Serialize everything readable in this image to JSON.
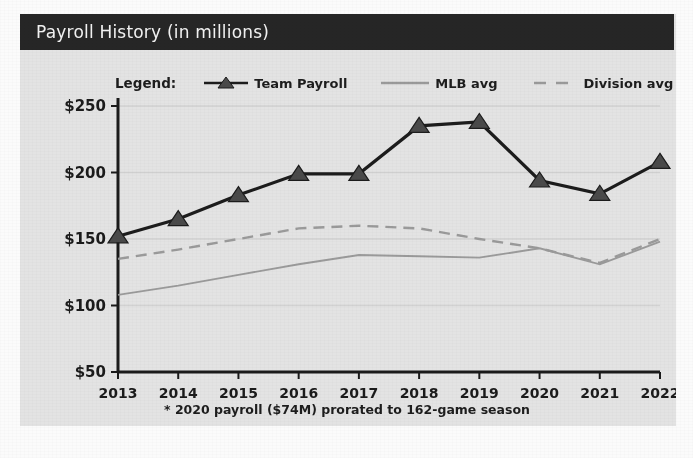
{
  "card": {
    "title": "Payroll History (in millions)",
    "header_bg": "#262626",
    "body_bg": "#e3e3e3"
  },
  "legend": {
    "label": "Legend:",
    "entries": [
      {
        "name": "Team Payroll",
        "style": "line-with-triangle-marker",
        "color": "#1c1c1c"
      },
      {
        "name": "MLB avg",
        "style": "solid-line",
        "color": "#9a9a9a"
      },
      {
        "name": "Division avg",
        "style": "dashed-line",
        "color": "#9a9a9a"
      }
    ]
  },
  "footnote": "* 2020 payroll ($74M) prorated to 162-game season",
  "axes": {
    "y_ticks": [
      "$50",
      "$100",
      "$150",
      "$200",
      "$250"
    ],
    "x_ticks": [
      "2013",
      "2014",
      "2015",
      "2016",
      "2017",
      "2018",
      "2019",
      "2020",
      "2021",
      "2022"
    ]
  },
  "chart_data": {
    "type": "line",
    "title": "Payroll History (in millions)",
    "subtitle": "",
    "xlabel": "",
    "ylabel": "",
    "x": [
      "2013",
      "2014",
      "2015",
      "2016",
      "2017",
      "2018",
      "2019",
      "2020",
      "2021",
      "2022"
    ],
    "categories": [
      "2013",
      "2014",
      "2015",
      "2016",
      "2017",
      "2018",
      "2019",
      "2020",
      "2021",
      "2022"
    ],
    "ylim": [
      50,
      250
    ],
    "xlim": [
      "2013",
      "2022"
    ],
    "ytick_values": [
      50,
      100,
      150,
      200,
      250
    ],
    "ytick_labels": [
      "$50",
      "$100",
      "$150",
      "$200",
      "$250"
    ],
    "grid": "horizontal",
    "legend_position": "above-plot",
    "units": "millions of USD",
    "annotations": [
      "* 2020 payroll ($74M) prorated to 162-game season"
    ],
    "series": [
      {
        "name": "Team Payroll",
        "marker": "triangle",
        "color": "#1c1c1c",
        "style": "solid",
        "values": [
          152,
          165,
          183,
          199,
          199,
          235,
          238,
          194,
          184,
          208
        ]
      },
      {
        "name": "MLB avg",
        "marker": "none",
        "color": "#9a9a9a",
        "style": "solid",
        "values": [
          108,
          115,
          123,
          131,
          138,
          137,
          136,
          143,
          131,
          148
        ]
      },
      {
        "name": "Division avg",
        "marker": "none",
        "color": "#9a9a9a",
        "style": "dashed",
        "values": [
          135,
          142,
          150,
          158,
          160,
          158,
          150,
          143,
          132,
          150
        ]
      }
    ]
  }
}
